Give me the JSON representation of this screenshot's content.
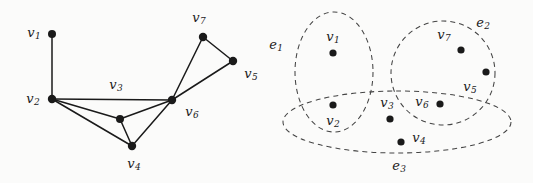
{
  "figure": {
    "background_color": "#fbfbfa",
    "ink_color": "#1a1a1a"
  },
  "graph": {
    "name": "left-graph",
    "vertices": [
      {
        "id": "v1",
        "label": "v",
        "sub": "1",
        "cx": 52,
        "cy": 34,
        "r": 4.0,
        "label_x": 34,
        "label_y": 33,
        "labelled": true
      },
      {
        "id": "v2",
        "label": "v",
        "sub": "2",
        "cx": 52,
        "cy": 99,
        "r": 4.2,
        "label_x": 33,
        "label_y": 99,
        "labelled": true
      },
      {
        "id": "v3node",
        "label": "",
        "sub": "",
        "cx": 120,
        "cy": 119,
        "r": 4.0,
        "label_x": 0,
        "label_y": 0,
        "labelled": false
      },
      {
        "id": "v4",
        "label": "v",
        "sub": "4",
        "cx": 132,
        "cy": 146,
        "r": 4.2,
        "label_x": 134,
        "label_y": 164,
        "labelled": true
      },
      {
        "id": "v5",
        "label": "v",
        "sub": "5",
        "cx": 233,
        "cy": 61,
        "r": 4.2,
        "label_x": 251,
        "label_y": 74,
        "labelled": true
      },
      {
        "id": "v6",
        "label": "v",
        "sub": "6",
        "cx": 172,
        "cy": 100,
        "r": 4.2,
        "label_x": 192,
        "label_y": 112,
        "labelled": true
      },
      {
        "id": "v7",
        "label": "v",
        "sub": "7",
        "cx": 203,
        "cy": 37,
        "r": 4.2,
        "label_x": 199,
        "label_y": 18,
        "labelled": true
      }
    ],
    "edges": [
      {
        "from": "v1",
        "to": "v2"
      },
      {
        "from": "v2",
        "to": "v6"
      },
      {
        "from": "v2",
        "to": "v3node"
      },
      {
        "from": "v2",
        "to": "v4"
      },
      {
        "from": "v3node",
        "to": "v4"
      },
      {
        "from": "v3node",
        "to": "v6"
      },
      {
        "from": "v4",
        "to": "v6"
      },
      {
        "from": "v6",
        "to": "v7"
      },
      {
        "from": "v6",
        "to": "v5"
      },
      {
        "from": "v7",
        "to": "v5"
      }
    ],
    "edge_labels": [
      {
        "id": "v3",
        "label": "v",
        "sub": "3",
        "label_x": 116,
        "label_y": 85
      }
    ]
  },
  "hypergraph": {
    "name": "right-hypergraph",
    "hyperedges": [
      {
        "id": "e1",
        "label": "e",
        "sub": "1",
        "cx": 334,
        "cy": 72,
        "rx": 39,
        "ry": 60,
        "rotation": 0,
        "label_x": 276,
        "label_y": 45
      },
      {
        "id": "e2",
        "label": "e",
        "sub": "2",
        "cx": 443,
        "cy": 73,
        "rx": 52,
        "ry": 52,
        "rotation": 0,
        "label_x": 483,
        "label_y": 23
      },
      {
        "id": "e3",
        "label": "e",
        "sub": "3",
        "cx": 397,
        "cy": 122,
        "rx": 114,
        "ry": 31,
        "rotation": 0,
        "label_x": 399,
        "label_y": 166
      }
    ],
    "vertices": [
      {
        "id": "v1",
        "label": "v",
        "sub": "1",
        "cx": 333,
        "cy": 53,
        "r": 3.6,
        "label_x": 333,
        "label_y": 37
      },
      {
        "id": "v2",
        "label": "v",
        "sub": "2",
        "cx": 333,
        "cy": 105,
        "r": 3.6,
        "label_x": 333,
        "label_y": 121
      },
      {
        "id": "v3",
        "label": "v",
        "sub": "3",
        "cx": 390,
        "cy": 119,
        "r": 3.6,
        "label_x": 387,
        "label_y": 103
      },
      {
        "id": "v4",
        "label": "v",
        "sub": "4",
        "cx": 401,
        "cy": 142,
        "r": 3.6,
        "label_x": 419,
        "label_y": 138
      },
      {
        "id": "v5",
        "label": "v",
        "sub": "5",
        "cx": 486,
        "cy": 72,
        "r": 3.6,
        "label_x": 470,
        "label_y": 87
      },
      {
        "id": "v6",
        "label": "v",
        "sub": "6",
        "cx": 440,
        "cy": 104,
        "r": 3.6,
        "label_x": 422,
        "label_y": 102
      },
      {
        "id": "v7",
        "label": "v",
        "sub": "7",
        "cx": 461,
        "cy": 50,
        "r": 3.6,
        "label_x": 444,
        "label_y": 35
      }
    ]
  }
}
